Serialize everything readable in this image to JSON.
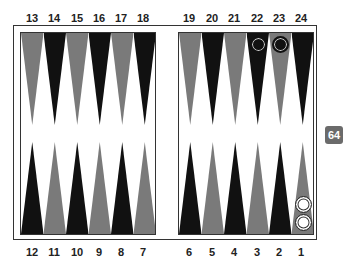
{
  "board": {
    "colors": {
      "dark_point": "#111111",
      "light_point": "#7a7a7a",
      "frame": "#333333",
      "background": "#ffffff",
      "cube": "#6b6b6b"
    },
    "top_labels": [
      "13",
      "14",
      "15",
      "16",
      "17",
      "18",
      "19",
      "20",
      "21",
      "22",
      "23",
      "24"
    ],
    "bottom_labels": [
      "12",
      "11",
      "10",
      "9",
      "8",
      "7",
      "6",
      "5",
      "4",
      "3",
      "2",
      "1"
    ],
    "checkers": [
      {
        "point": 22,
        "color": "dark",
        "count": 1
      },
      {
        "point": 23,
        "color": "dark",
        "count": 1
      },
      {
        "point": 1,
        "color": "light",
        "count": 2
      }
    ],
    "doubling_cube": {
      "value": "64"
    }
  }
}
